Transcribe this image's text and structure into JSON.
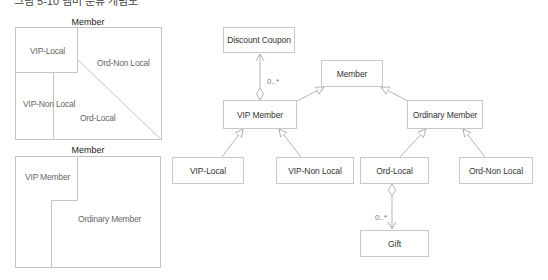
{
  "caption": "그림 5-10 멤버 분류 개념도",
  "venn_top": {
    "title": "Member",
    "regions": [
      "VIP-Local",
      "Ord-Non Local",
      "VIP-Non Local",
      "Ord-Local"
    ]
  },
  "venn_bottom": {
    "title": "Member",
    "regions": [
      "VIP Member",
      "Ordinary Member"
    ]
  },
  "uml": {
    "classes": {
      "discount_coupon": "Discount Coupon",
      "member": "Member",
      "vip_member": "VIP Member",
      "ordinary_member": "Ordinary Member",
      "vip_local": "VIP-Local",
      "vip_non_local": "VIP-Non Local",
      "ord_local": "Ord-Local",
      "ord_non_local": "Ord-Non Local",
      "gift": "Gift"
    },
    "multiplicities": {
      "coupon": "0..*",
      "gift": "0..*"
    },
    "colors": {
      "line": "#b5b5b5",
      "border": "#c8c8c8"
    }
  }
}
